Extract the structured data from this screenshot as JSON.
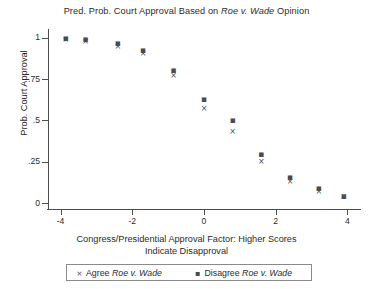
{
  "chart_data": {
    "type": "scatter",
    "title": "Pred. Prob. Court Approval Based on Roe v. Wade Opinion",
    "title_parts": {
      "before": "Pred. Prob. Court Approval Based on ",
      "italic": "Roe v. Wade",
      "after": " Opinion"
    },
    "xlabel_line1": "Congress/Presidential Approval Factor: Higher Scores",
    "xlabel_line2": "Indicate Disapproval",
    "ylabel": "Prob. Court Approval",
    "xlim": [
      -4.35,
      4.35
    ],
    "ylim": [
      -0.035,
      1.04
    ],
    "xticks": [
      -4,
      -2,
      0,
      2,
      4
    ],
    "xtick_labels": [
      "-4",
      "-2",
      "0",
      "2",
      "4"
    ],
    "yticks": [
      0,
      0.25,
      0.5,
      0.75,
      1
    ],
    "ytick_labels": [
      "0",
      ".25",
      ".5",
      ".75",
      "1"
    ],
    "grid": false,
    "legend_position": "below-axis",
    "marker_color": "#4a4a52",
    "series": [
      {
        "name": "Agree Roe v. Wade",
        "legend_label_italic": "Roe v. Wade",
        "legend_label_before": "Agree ",
        "marker": "x",
        "x": [
          -3.85,
          -3.3,
          -2.4,
          -1.7,
          -0.85,
          0.0,
          0.8,
          1.6,
          2.4,
          3.2,
          3.9
        ],
        "y": [
          0.985,
          0.975,
          0.945,
          0.9,
          0.77,
          0.57,
          0.43,
          0.25,
          0.13,
          0.07,
          0.035
        ]
      },
      {
        "name": "Disagree Roe v. Wade",
        "legend_label_italic": "Roe v. Wade",
        "legend_label_before": "Disagree ",
        "marker": "square-dot",
        "x": [
          -3.85,
          -3.3,
          -2.4,
          -1.7,
          -0.85,
          0.0,
          0.8,
          1.6,
          2.4,
          3.2,
          3.9
        ],
        "y": [
          0.995,
          0.99,
          0.965,
          0.925,
          0.805,
          0.63,
          0.5,
          0.3,
          0.16,
          0.09,
          0.045
        ]
      }
    ]
  },
  "legend": {
    "agree_prefix": "Agree ",
    "agree_italic": "Roe v. Wade",
    "disagree_prefix": "Disagree ",
    "disagree_italic": "Roe v. Wade",
    "key_agree": "×",
    "key_disagree": "▪"
  }
}
